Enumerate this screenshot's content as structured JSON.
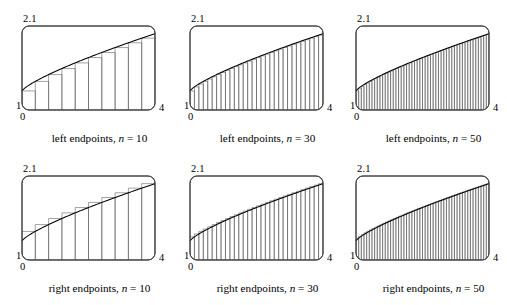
{
  "figure": {
    "axis": {
      "y_top_label": "2.1",
      "y_bottom_label": "1",
      "x_left_label": "0",
      "x_right_label": "4"
    },
    "style": {
      "curve_color": "#000000",
      "rect_stroke": "#555555",
      "box_stroke": "#444444",
      "background": "#ffffff"
    }
  },
  "panels": [
    {
      "id": "left-10",
      "caption_prefix": "left endpoints,",
      "caption_var": "n",
      "caption_eq": "= 10",
      "rule": "left",
      "n": 10
    },
    {
      "id": "left-30",
      "caption_prefix": "left endpoints,",
      "caption_var": "n",
      "caption_eq": "= 30",
      "rule": "left",
      "n": 30
    },
    {
      "id": "left-50",
      "caption_prefix": "left endpoints,",
      "caption_var": "n",
      "caption_eq": "= 50",
      "rule": "left",
      "n": 50
    },
    {
      "id": "right-10",
      "caption_prefix": "right endpoints,",
      "caption_var": "n",
      "caption_eq": "= 10",
      "rule": "right",
      "n": 10
    },
    {
      "id": "right-30",
      "caption_prefix": "right endpoints,",
      "caption_var": "n",
      "caption_eq": "= 30",
      "rule": "right",
      "n": 30
    },
    {
      "id": "right-50",
      "caption_prefix": "right endpoints,",
      "caption_var": "n",
      "caption_eq": "= 50",
      "rule": "right",
      "n": 50
    }
  ],
  "chart_data": {
    "type": "area",
    "title": "",
    "xlabel": "",
    "ylabel": "",
    "xlim": [
      0,
      4
    ],
    "ylim": [
      1,
      2.1
    ],
    "grid": false,
    "legend": "none",
    "curve": {
      "description": "increasing concave-down curve",
      "x": [
        0,
        0.4,
        0.8,
        1.2,
        1.6,
        2.0,
        2.4,
        2.8,
        3.2,
        3.6,
        4.0
      ],
      "y": [
        1.25,
        1.34,
        1.43,
        1.51,
        1.58,
        1.65,
        1.72,
        1.79,
        1.86,
        1.93,
        2.0
      ]
    },
    "riemann_sums": [
      {
        "name": "left endpoints, n = 10",
        "rule": "left",
        "n": 10,
        "dx": 0.4,
        "sample_x": [
          0,
          0.4,
          0.8,
          1.2,
          1.6,
          2.0,
          2.4,
          2.8,
          3.2,
          3.6
        ],
        "heights": [
          1.25,
          1.34,
          1.43,
          1.51,
          1.58,
          1.65,
          1.72,
          1.79,
          1.86,
          1.93
        ]
      },
      {
        "name": "left endpoints, n = 30",
        "rule": "left",
        "n": 30,
        "dx": 0.1333
      },
      {
        "name": "left endpoints, n = 50",
        "rule": "left",
        "n": 50,
        "dx": 0.08
      },
      {
        "name": "right endpoints, n = 10",
        "rule": "right",
        "n": 10,
        "dx": 0.4,
        "sample_x": [
          0.4,
          0.8,
          1.2,
          1.6,
          2.0,
          2.4,
          2.8,
          3.2,
          3.6,
          4.0
        ],
        "heights": [
          1.34,
          1.43,
          1.51,
          1.58,
          1.65,
          1.72,
          1.79,
          1.86,
          1.93,
          2.0
        ]
      },
      {
        "name": "right endpoints, n = 30",
        "rule": "right",
        "n": 30,
        "dx": 0.1333
      },
      {
        "name": "right endpoints, n = 50",
        "rule": "right",
        "n": 50,
        "dx": 0.08
      }
    ]
  }
}
